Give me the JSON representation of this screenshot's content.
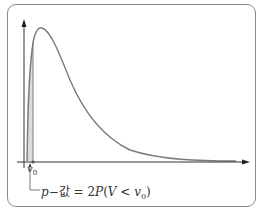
{
  "diagram": {
    "type": "density-curve-right-skewed",
    "colors": {
      "curve": "#7a7a7a",
      "shade": "#dcdcdc",
      "axis": "#333333",
      "frame": "#8a8a8a"
    },
    "labels": {
      "v0_var": "v",
      "v0_sub": "0",
      "formula_p": "p",
      "formula_mid": "−값 = 2",
      "formula_P": "P",
      "formula_open": "(",
      "formula_V": "V",
      "formula_lt": " < ",
      "formula_v": "v",
      "formula_sub": "0",
      "formula_close": ")"
    }
  }
}
